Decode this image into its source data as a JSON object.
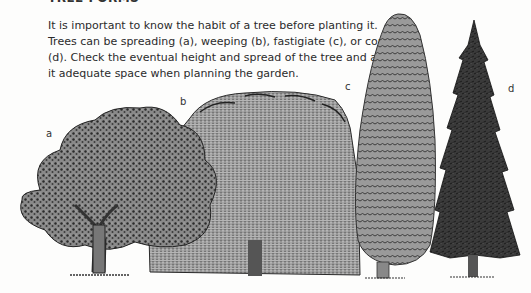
{
  "heading": "TREE FORMS",
  "intro": "It is important to know the habit of a tree before planting it. Trees can be spreading (a), weeping (b), fastigiate (c), or conical (d). Check the eventual height and spread of the tree and allow it adequate space when planning the garden.",
  "trees": [
    {
      "label": "a",
      "form": "spreading"
    },
    {
      "label": "b",
      "form": "weeping"
    },
    {
      "label": "c",
      "form": "fastigiate"
    },
    {
      "label": "d",
      "form": "conical"
    }
  ]
}
